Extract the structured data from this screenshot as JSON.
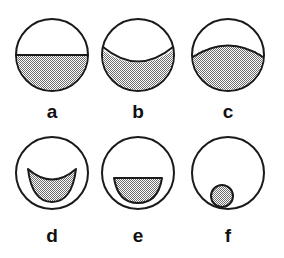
{
  "figure": {
    "title": "",
    "background_color": "#ffffff",
    "outline_color": "#1a1a1a",
    "fill_color": "#a8a8a8",
    "fill_pattern": "checkerboard-dither-50-percent",
    "columns": 3,
    "rows": 2,
    "panels": [
      {
        "id": "a",
        "label": "a",
        "row": 0,
        "column": 0,
        "circle": {
          "cx": 52,
          "cy": 55,
          "r": 36
        },
        "label_position": {
          "x": 52,
          "y": 118
        },
        "shape": "half-disc-flat-chord",
        "description": "circle divided by a straight horizontal chord through the centre; lower half shaded",
        "boundary": "straight",
        "shaded_fraction": 0.5
      },
      {
        "id": "b",
        "label": "b",
        "row": 0,
        "column": 1,
        "circle": {
          "cx": 138,
          "cy": 55,
          "r": 36
        },
        "label_position": {
          "x": 138,
          "y": 118
        },
        "shape": "concave-up-boundary",
        "description": "circle with a boundary arc curving downward in the middle; lower region shaded",
        "boundary": "concave-up",
        "shaded_fraction": 0.42
      },
      {
        "id": "c",
        "label": "c",
        "row": 0,
        "column": 2,
        "circle": {
          "cx": 228,
          "cy": 55,
          "r": 36
        },
        "label_position": {
          "x": 228,
          "y": 118
        },
        "shape": "convex-up-boundary",
        "description": "circle with a boundary arc bulging upward in the middle; larger lower region shaded",
        "boundary": "convex-up",
        "shaded_fraction": 0.62
      },
      {
        "id": "d",
        "label": "d",
        "row": 1,
        "column": 0,
        "circle": {
          "cx": 52,
          "cy": 173,
          "r": 36
        },
        "label_position": {
          "x": 52,
          "y": 242
        },
        "shape": "crescent",
        "description": "small crescent (lune) inside the circle; concave-up top edge, rounded bottom",
        "boundary": "crescent",
        "shaded_fraction": 0.14
      },
      {
        "id": "e",
        "label": "e",
        "row": 1,
        "column": 1,
        "circle": {
          "cx": 138,
          "cy": 173,
          "r": 36
        },
        "label_position": {
          "x": 138,
          "y": 242
        },
        "shape": "semicircle",
        "description": "small half-disc inside the circle; flat top edge, rounded bottom",
        "boundary": "straight-top",
        "shaded_fraction": 0.13
      },
      {
        "id": "f",
        "label": "f",
        "row": 1,
        "column": 2,
        "circle": {
          "cx": 228,
          "cy": 173,
          "r": 36
        },
        "label_position": {
          "x": 228,
          "y": 242
        },
        "shape": "small-disc",
        "description": "small fully shaded circle inside the lower-left part of the circle",
        "boundary": "closed-circle",
        "shaded_fraction": 0.09,
        "inner_circle": {
          "cx": 222,
          "cy": 196,
          "r": 11
        }
      }
    ]
  }
}
